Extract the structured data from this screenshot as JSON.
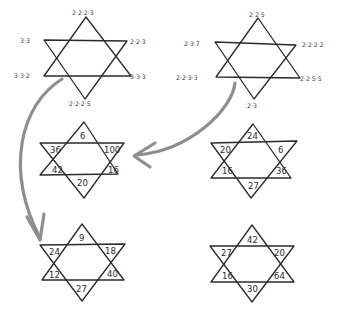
{
  "puzzle": {
    "factor_stars": [
      {
        "id": "top-left",
        "labels": {
          "top": "2·2·2·3",
          "upper_left": "3·3",
          "upper_right": "2·2·3",
          "lower_left": "3·3·2",
          "lower_right": "3·3·3",
          "bottom": "2·2·2·5"
        }
      },
      {
        "id": "top-right",
        "labels": {
          "top": "2·2·5",
          "upper_left": "2·3·7",
          "upper_right": "2·2·2·2",
          "lower_left": "2·2·3·3",
          "lower_right": "2·2·5·5",
          "bottom": "2·3"
        }
      }
    ],
    "number_stars": [
      {
        "id": "middle-left",
        "values": {
          "top": "6",
          "upper_left": "36",
          "upper_right": "100",
          "lower_left": "42",
          "lower_right": "16",
          "bottom": "20"
        }
      },
      {
        "id": "middle-right",
        "values": {
          "top": "24",
          "upper_left": "20",
          "upper_right": "6",
          "lower_left": "16",
          "lower_right": "36",
          "bottom": "27"
        }
      },
      {
        "id": "bottom-left",
        "values": {
          "top": "9",
          "upper_left": "24",
          "upper_right": "18",
          "lower_left": "12",
          "lower_right": "40",
          "bottom": "27"
        }
      },
      {
        "id": "bottom-right",
        "values": {
          "top": "42",
          "upper_left": "27",
          "upper_right": "20",
          "lower_left": "16",
          "lower_right": "64",
          "bottom": "30"
        }
      }
    ],
    "arrows": [
      {
        "from": "top-left",
        "to": "bottom-left"
      },
      {
        "from": "top-right",
        "to": "middle-left"
      }
    ],
    "colors": {
      "line": "#2a2a2a",
      "arrow": "#8e8e8e",
      "background": "#ffffff"
    }
  }
}
